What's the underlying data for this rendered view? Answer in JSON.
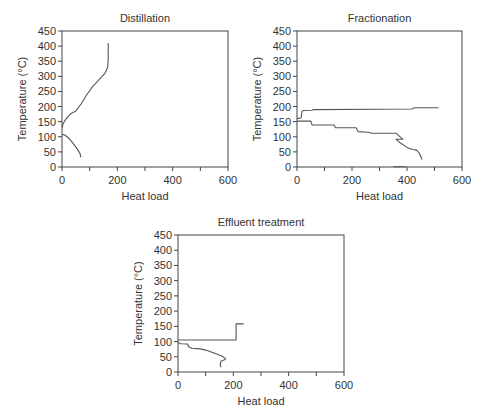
{
  "figure": {
    "panels": [
      "Distillation",
      "Fractionation",
      "Effluent treatment"
    ]
  },
  "chart_data": [
    {
      "type": "line",
      "title": "Distillation",
      "xlabel": "Heat load",
      "ylabel": "Temperature (°C)",
      "xlim": [
        0,
        600
      ],
      "ylim": [
        0,
        450
      ],
      "xticks": [
        0,
        200,
        400,
        600
      ],
      "yticks": [
        0,
        50,
        100,
        150,
        200,
        250,
        300,
        350,
        400,
        450
      ],
      "grid": false,
      "series": [
        {
          "name": "Hot curve",
          "points": [
            [
              0,
              130
            ],
            [
              5,
              145
            ],
            [
              15,
              160
            ],
            [
              30,
              175
            ],
            [
              50,
              185
            ],
            [
              70,
              210
            ],
            [
              90,
              240
            ],
            [
              110,
              265
            ],
            [
              135,
              290
            ],
            [
              155,
              310
            ],
            [
              165,
              330
            ],
            [
              167,
              360
            ],
            [
              167,
              410
            ]
          ]
        },
        {
          "name": "Cold curve",
          "points": [
            [
              0,
              108
            ],
            [
              10,
              106
            ],
            [
              25,
              95
            ],
            [
              40,
              78
            ],
            [
              55,
              60
            ],
            [
              65,
              45
            ],
            [
              68,
              32
            ]
          ]
        }
      ]
    },
    {
      "type": "line",
      "title": "Fractionation",
      "xlabel": "Heat load",
      "ylabel": "Temperature (°C)",
      "xlim": [
        0,
        600
      ],
      "ylim": [
        0,
        450
      ],
      "xticks": [
        0,
        200,
        400,
        600
      ],
      "yticks": [
        0,
        50,
        100,
        150,
        200,
        250,
        300,
        350,
        400,
        450
      ],
      "grid": false,
      "series": [
        {
          "name": "Upper curve",
          "points": [
            [
              0,
              160
            ],
            [
              15,
              162
            ],
            [
              18,
              183
            ],
            [
              22,
              187
            ],
            [
              55,
              188
            ],
            [
              60,
              190
            ],
            [
              300,
              191
            ],
            [
              420,
              192
            ],
            [
              425,
              196
            ],
            [
              515,
              196
            ]
          ]
        },
        {
          "name": "Lower curve",
          "points": [
            [
              0,
              152
            ],
            [
              50,
              152
            ],
            [
              55,
              139
            ],
            [
              135,
              139
            ],
            [
              140,
              130
            ],
            [
              215,
              130
            ],
            [
              222,
              117
            ],
            [
              260,
              115
            ],
            [
              270,
              112
            ],
            [
              360,
              112
            ],
            [
              375,
              100
            ],
            [
              385,
              92
            ],
            [
              360,
              92
            ],
            [
              375,
              80
            ],
            [
              400,
              65
            ],
            [
              420,
              58
            ],
            [
              435,
              56
            ],
            [
              445,
              45
            ],
            [
              455,
              25
            ]
          ]
        },
        {
          "name": "Baseline segment",
          "points": [
            [
              350,
              1
            ],
            [
              395,
              1
            ]
          ]
        }
      ]
    },
    {
      "type": "line",
      "title": "Effluent treatment",
      "xlabel": "Heat load",
      "ylabel": "Temperature (°C)",
      "xlim": [
        0,
        600
      ],
      "ylim": [
        0,
        450
      ],
      "xticks": [
        0,
        200,
        400,
        600
      ],
      "yticks": [
        0,
        50,
        100,
        150,
        200,
        250,
        300,
        350,
        400,
        450
      ],
      "grid": false,
      "series": [
        {
          "name": "Step curve",
          "points": [
            [
              0,
              105
            ],
            [
              210,
              105
            ],
            [
              210,
              158
            ],
            [
              238,
              158
            ]
          ]
        },
        {
          "name": "Cold curve",
          "points": [
            [
              0,
              97
            ],
            [
              10,
              93
            ],
            [
              35,
              92
            ],
            [
              38,
              83
            ],
            [
              50,
              78
            ],
            [
              80,
              76
            ],
            [
              100,
              72
            ],
            [
              130,
              62
            ],
            [
              160,
              52
            ],
            [
              172,
              44
            ],
            [
              168,
              40
            ],
            [
              155,
              35
            ],
            [
              152,
              25
            ],
            [
              155,
              15
            ]
          ]
        }
      ]
    }
  ]
}
